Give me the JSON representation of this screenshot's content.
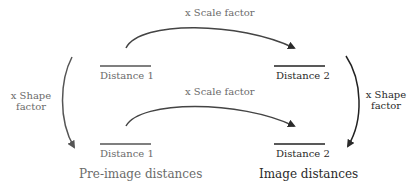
{
  "diagram": {
    "top_scale_label": "x Scale factor",
    "bottom_scale_label": "x Scale factor",
    "left_shape_label_line1": "x Shape",
    "left_shape_label_line2": "factor",
    "right_shape_label_line1": "x Shape",
    "right_shape_label_line2": "factor",
    "top_left_distance": "Distance 1",
    "top_right_distance": "Distance 2",
    "bottom_left_distance": "Distance 1",
    "bottom_right_distance": "Distance 2",
    "left_caption": "Pre-image distances",
    "right_caption": "Image distances"
  },
  "colors": {
    "pre_image": "#6b6b6b",
    "image": "#2a2a2a"
  }
}
